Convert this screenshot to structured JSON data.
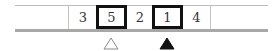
{
  "diagram": {
    "cells": [
      {
        "value": "3",
        "highlighted": false
      },
      {
        "value": "5",
        "highlighted": true
      },
      {
        "value": "2",
        "highlighted": false
      },
      {
        "value": "1",
        "highlighted": true
      },
      {
        "value": "4",
        "highlighted": false
      }
    ],
    "markers": [
      {
        "under_index": 1,
        "style": "hollow-triangle"
      },
      {
        "under_index": 3,
        "style": "filled-triangle"
      }
    ],
    "colors": {
      "highlight_border": "#111111",
      "bar": "#a8a8a8",
      "lines": "#bdbdbd",
      "text": "#333333"
    }
  }
}
